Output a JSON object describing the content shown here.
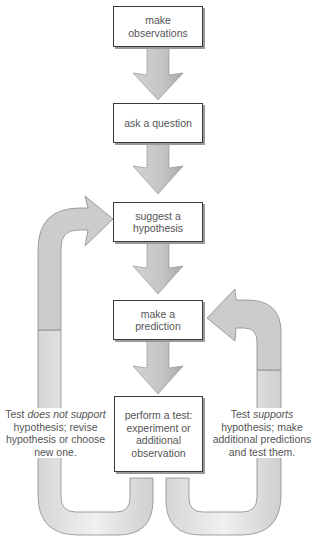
{
  "colors": {
    "arrow_fill": "#c8c8c8",
    "arrow_edge": "#8a8a8a",
    "loop_fill": "#e6e6e6",
    "box_border": "#3a3a3a",
    "text": "#555555"
  },
  "steps": [
    {
      "id": "observe",
      "lines": [
        "make",
        "observations"
      ]
    },
    {
      "id": "question",
      "lines": [
        "ask a question"
      ]
    },
    {
      "id": "hypothesis",
      "lines": [
        "suggest a",
        "hypothesis"
      ]
    },
    {
      "id": "prediction",
      "lines": [
        "make a",
        "prediction"
      ]
    },
    {
      "id": "test",
      "lines": [
        "perform a test:",
        "experiment or",
        "additional",
        "observation"
      ]
    }
  ],
  "loops": {
    "left": {
      "prefix": "Test ",
      "emphasis": "does not support",
      "lines": [
        "hypothesis; revise",
        "hypothesis or choose",
        "new one."
      ],
      "target": "hypothesis"
    },
    "right": {
      "prefix": "Test ",
      "emphasis": "supports",
      "lines": [
        "hypothesis; make",
        "additional predictions",
        "and test them."
      ],
      "target": "prediction"
    }
  }
}
